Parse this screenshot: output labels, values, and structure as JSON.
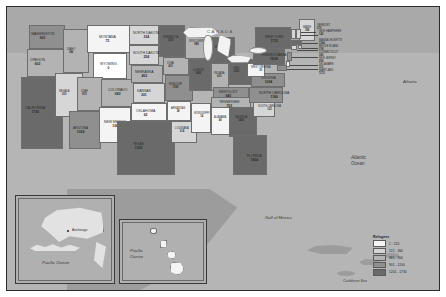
{
  "map": {
    "title": "United States refugee arrivals choropleth map",
    "background_color": "#b5b5b5",
    "border_color": "#2b2b2b"
  },
  "region_labels": {
    "canada": "CANADA",
    "atlantic_top": "Atlantic",
    "atlantic_ocean": "Atlantic\nOcean",
    "atlantic_ocean_line1": "Atlantic",
    "atlantic_ocean_line2": "Ocean",
    "gulf_of_mexico": "Gulf of Mexico",
    "caribbean_sea": "Caribbean Sea",
    "pacific_ocean_alaska": "Pacific Ocean",
    "pacific_ocean_hawaii_line1": "Pacific",
    "pacific_ocean_hawaii_line2": "Ocean",
    "anchorage": "Anchorage"
  },
  "legend": {
    "title": "Refugees",
    "classes": [
      {
        "label": "1 - 120",
        "color": "#f4f4f4"
      },
      {
        "label": "121 - 360",
        "color": "#d6d6d6"
      },
      {
        "label": "361 - 900",
        "color": "#b3b3b3"
      },
      {
        "label": "901 - 1200",
        "color": "#8f8f8f"
      },
      {
        "label": "1201 - 1730",
        "color": "#6a6a6a"
      }
    ]
  },
  "states": [
    {
      "code": "WA",
      "name": "WASHINGTON",
      "value": "901",
      "class": 3,
      "color": "#8f8f8f",
      "x": 22,
      "y": 18,
      "w": 36,
      "h": 24,
      "lx": 24,
      "ly": 26
    },
    {
      "code": "OR",
      "name": "OREGON",
      "value": "602",
      "class": 2,
      "color": "#b3b3b3",
      "x": 20,
      "y": 42,
      "w": 37,
      "h": 28,
      "lx": 23,
      "ly": 52
    },
    {
      "code": "CA",
      "name": "CALIFORNIA",
      "value": "1730",
      "class": 4,
      "color": "#6a6a6a",
      "x": 14,
      "y": 70,
      "w": 42,
      "h": 72,
      "lx": 18,
      "ly": 100
    },
    {
      "code": "NV",
      "name": "NEVADA",
      "value": "203",
      "class": 1,
      "color": "#d6d6d6",
      "x": 48,
      "y": 66,
      "w": 28,
      "h": 44,
      "lx": 52,
      "ly": 84
    },
    {
      "code": "ID",
      "name": "IDAHO",
      "value": "386",
      "class": 2,
      "color": "#b3b3b3",
      "x": 56,
      "y": 22,
      "w": 26,
      "h": 44,
      "lx": 60,
      "ly": 42
    },
    {
      "code": "MT",
      "name": "MONTANA",
      "value": "72",
      "class": 0,
      "color": "#f4f4f4",
      "x": 80,
      "y": 18,
      "w": 44,
      "h": 28,
      "lx": 92,
      "ly": 29
    },
    {
      "code": "WY",
      "name": "WYOMING",
      "value": "0",
      "class": 0,
      "color": "#ffffff",
      "x": 86,
      "y": 46,
      "w": 34,
      "h": 26,
      "lx": 93,
      "ly": 56
    },
    {
      "code": "UT",
      "name": "UTAH",
      "value": "872",
      "class": 2,
      "color": "#b3b3b3",
      "x": 70,
      "y": 70,
      "w": 26,
      "h": 34,
      "lx": 74,
      "ly": 84
    },
    {
      "code": "AZ",
      "name": "ARIZONA",
      "value": "1024",
      "class": 3,
      "color": "#8f8f8f",
      "x": 62,
      "y": 104,
      "w": 32,
      "h": 38,
      "lx": 66,
      "ly": 120
    },
    {
      "code": "CO",
      "name": "COLORADO",
      "value": "682",
      "class": 2,
      "color": "#b3b3b3",
      "x": 94,
      "y": 72,
      "w": 34,
      "h": 28,
      "lx": 101,
      "ly": 82
    },
    {
      "code": "NM",
      "name": "NEW MEXICO",
      "value": "106",
      "class": 0,
      "color": "#f4f4f4",
      "x": 92,
      "y": 100,
      "w": 32,
      "h": 36,
      "lx": 97,
      "ly": 114
    },
    {
      "code": "ND",
      "name": "NORTH DAKOTA",
      "value": "334",
      "class": 1,
      "color": "#d6d6d6",
      "x": 122,
      "y": 18,
      "w": 30,
      "h": 20,
      "lx": 126,
      "ly": 25
    },
    {
      "code": "SD",
      "name": "SOUTH DAKOTA",
      "value": "254",
      "class": 1,
      "color": "#d6d6d6",
      "x": 122,
      "y": 38,
      "w": 30,
      "h": 20,
      "lx": 126,
      "ly": 45
    },
    {
      "code": "NE",
      "name": "NEBRASKA",
      "value": "452",
      "class": 2,
      "color": "#b3b3b3",
      "x": 124,
      "y": 58,
      "w": 32,
      "h": 18,
      "lx": 128,
      "ly": 64
    },
    {
      "code": "KS",
      "name": "KANSAS",
      "value": "301",
      "class": 1,
      "color": "#d6d6d6",
      "x": 126,
      "y": 76,
      "w": 32,
      "h": 20,
      "lx": 130,
      "ly": 83
    },
    {
      "code": "OK",
      "name": "OKLAHOMA",
      "value": "62",
      "class": 0,
      "color": "#f4f4f4",
      "x": 124,
      "y": 96,
      "w": 36,
      "h": 18,
      "lx": 129,
      "ly": 103
    },
    {
      "code": "TX",
      "name": "TEXAS",
      "value": "1536",
      "class": 4,
      "color": "#6a6a6a",
      "x": 110,
      "y": 114,
      "w": 58,
      "h": 54,
      "lx": 126,
      "ly": 136
    },
    {
      "code": "MN",
      "name": "MINNESOTA",
      "value": "1210",
      "class": 4,
      "color": "#6a6a6a",
      "x": 152,
      "y": 18,
      "w": 26,
      "h": 32,
      "lx": 156,
      "ly": 30
    },
    {
      "code": "IA",
      "name": "IOWA",
      "value": "410",
      "class": 2,
      "color": "#b3b3b3",
      "x": 156,
      "y": 50,
      "w": 26,
      "h": 18,
      "lx": 160,
      "ly": 56
    },
    {
      "code": "MO",
      "name": "MISSOURI",
      "value": "1108",
      "class": 3,
      "color": "#8f8f8f",
      "x": 158,
      "y": 68,
      "w": 28,
      "h": 26,
      "lx": 162,
      "ly": 77
    },
    {
      "code": "AR",
      "name": "ARKANSAS",
      "value": "38",
      "class": 0,
      "color": "#f4f4f4",
      "x": 160,
      "y": 94,
      "w": 24,
      "h": 20,
      "lx": 164,
      "ly": 101
    },
    {
      "code": "LA",
      "name": "LOUISIANA",
      "value": "214",
      "class": 1,
      "color": "#d6d6d6",
      "x": 164,
      "y": 114,
      "w": 26,
      "h": 22,
      "lx": 168,
      "ly": 121
    },
    {
      "code": "WI",
      "name": "WISCONSIN",
      "value": "688",
      "class": 2,
      "color": "#b3b3b3",
      "x": 178,
      "y": 24,
      "w": 24,
      "h": 28,
      "lx": 182,
      "ly": 34
    },
    {
      "code": "IL",
      "name": "ILLINOIS",
      "value": "1402",
      "class": 4,
      "color": "#6a6a6a",
      "x": 182,
      "y": 52,
      "w": 22,
      "h": 32,
      "lx": 186,
      "ly": 63
    },
    {
      "code": "MS",
      "name": "MISSISSIPPI",
      "value": "14",
      "class": 0,
      "color": "#f4f4f4",
      "x": 184,
      "y": 96,
      "w": 20,
      "h": 30,
      "lx": 187,
      "ly": 106
    },
    {
      "code": "MI",
      "name": "MICHIGAN",
      "value": "1688",
      "class": 4,
      "color": "#6a6a6a",
      "x": 202,
      "y": 30,
      "w": 26,
      "h": 28,
      "lx": 208,
      "ly": 40
    },
    {
      "code": "IN",
      "name": "INDIANA",
      "value": "620",
      "class": 2,
      "color": "#b3b3b3",
      "x": 204,
      "y": 56,
      "w": 18,
      "h": 28,
      "lx": 207,
      "ly": 66
    },
    {
      "code": "OH",
      "name": "OHIO",
      "value": "1320",
      "class": 4,
      "color": "#6a6a6a",
      "x": 222,
      "y": 52,
      "w": 24,
      "h": 26,
      "lx": 226,
      "ly": 61
    },
    {
      "code": "KY",
      "name": "KENTUCKY",
      "value": "940",
      "class": 3,
      "color": "#8f8f8f",
      "x": 206,
      "y": 80,
      "w": 36,
      "h": 14,
      "lx": 212,
      "ly": 84
    },
    {
      "code": "TN",
      "name": "TENNESSEE",
      "value": "702",
      "class": 2,
      "color": "#b3b3b3",
      "x": 204,
      "y": 90,
      "w": 40,
      "h": 14,
      "lx": 212,
      "ly": 94
    },
    {
      "code": "AL",
      "name": "ALABAMA",
      "value": "46",
      "class": 0,
      "color": "#f4f4f4",
      "x": 204,
      "y": 100,
      "w": 20,
      "h": 28,
      "lx": 207,
      "ly": 110
    },
    {
      "code": "GA",
      "name": "GEORGIA",
      "value": "1426",
      "class": 4,
      "color": "#6a6a6a",
      "x": 222,
      "y": 100,
      "w": 28,
      "h": 30,
      "lx": 228,
      "ly": 110
    },
    {
      "code": "FL",
      "name": "FLORIDA",
      "value": "1604",
      "class": 4,
      "color": "#6a6a6a",
      "x": 226,
      "y": 128,
      "w": 34,
      "h": 40,
      "lx": 240,
      "ly": 148
    },
    {
      "code": "SC",
      "name": "SOUTH CAROLINA",
      "value": "122",
      "class": 1,
      "color": "#d6d6d6",
      "x": 246,
      "y": 94,
      "w": 22,
      "h": 16,
      "lx": 251,
      "ly": 99
    },
    {
      "code": "NC",
      "name": "NORTH CAROLINA",
      "value": "1186",
      "class": 3,
      "color": "#8f8f8f",
      "x": 242,
      "y": 80,
      "w": 34,
      "h": 16,
      "lx": 252,
      "ly": 85
    },
    {
      "code": "VA",
      "name": "VIRGINIA",
      "value": "1094",
      "class": 3,
      "color": "#8f8f8f",
      "x": 244,
      "y": 66,
      "w": 34,
      "h": 14,
      "lx": 254,
      "ly": 70
    },
    {
      "code": "WV",
      "name": "WEST VIRGINIA",
      "value": "30",
      "class": 0,
      "color": "#f4f4f4",
      "x": 240,
      "y": 56,
      "w": 18,
      "h": 14,
      "lx": 244,
      "ly": 60
    },
    {
      "code": "PA",
      "name": "PENNSYLVANIA",
      "value": "1508",
      "class": 4,
      "color": "#6a6a6a",
      "x": 246,
      "y": 40,
      "w": 32,
      "h": 18,
      "lx": 254,
      "ly": 47
    },
    {
      "code": "NY",
      "name": "NEW YORK",
      "value": "1712",
      "class": 4,
      "color": "#6a6a6a",
      "x": 248,
      "y": 20,
      "w": 36,
      "h": 22,
      "lx": 258,
      "ly": 29
    },
    {
      "code": "ME",
      "name": "MAINE",
      "value": "358",
      "class": 1,
      "color": "#d6d6d6",
      "x": 292,
      "y": 12,
      "w": 16,
      "h": 22,
      "lx": 296,
      "ly": 20
    }
  ],
  "small_states": [
    {
      "code": "VT",
      "name": "VERMONT",
      "value": "270",
      "class": 1,
      "color": "#d6d6d6",
      "x": 284,
      "y": 22,
      "w": 5,
      "h": 10,
      "tx": 310,
      "ty": 18,
      "lnx": 289,
      "lny": 25,
      "lnw": 20
    },
    {
      "code": "NH",
      "name": "NEW HAMPSHIRE",
      "value": "142",
      "class": 1,
      "color": "#d6d6d6",
      "x": 289,
      "y": 22,
      "w": 5,
      "h": 10,
      "tx": 312,
      "ty": 24,
      "lnx": 294,
      "lny": 28,
      "lnw": 17
    },
    {
      "code": "MA",
      "name": "MASSACHUSETTS",
      "value": "1264",
      "class": 4,
      "color": "#6a6a6a",
      "x": 284,
      "y": 33,
      "w": 11,
      "h": 5,
      "tx": 312,
      "ty": 33,
      "lnx": 295,
      "lny": 36,
      "lnw": 16
    },
    {
      "code": "RI",
      "name": "RHODE ISLAND",
      "value": "218",
      "class": 1,
      "color": "#d6d6d6",
      "x": 291,
      "y": 38,
      "w": 4,
      "h": 4,
      "tx": 312,
      "ty": 39,
      "lnx": 295,
      "lny": 41,
      "lnw": 16
    },
    {
      "code": "CT",
      "name": "CONNECTICUT",
      "value": "340",
      "class": 1,
      "color": "#d6d6d6",
      "x": 284,
      "y": 38,
      "w": 6,
      "h": 5,
      "tx": 312,
      "ty": 45,
      "lnx": 290,
      "lny": 43,
      "lnw": 21
    },
    {
      "code": "NJ",
      "name": "NEW JERSEY",
      "value": "906",
      "class": 3,
      "color": "#8f8f8f",
      "x": 280,
      "y": 45,
      "w": 5,
      "h": 9,
      "tx": 312,
      "ty": 51,
      "lnx": 285,
      "lny": 50,
      "lnw": 26
    },
    {
      "code": "DE",
      "name": "DELAWARE",
      "value": "110",
      "class": 0,
      "color": "#f4f4f4",
      "x": 279,
      "y": 54,
      "w": 4,
      "h": 6,
      "tx": 312,
      "ty": 57,
      "lnx": 283,
      "lny": 58,
      "lnw": 28
    },
    {
      "code": "MD",
      "name": "MARYLAND",
      "value": "1172",
      "class": 3,
      "color": "#8f8f8f",
      "x": 270,
      "y": 58,
      "w": 10,
      "h": 6,
      "tx": 312,
      "ty": 63,
      "lnx": 280,
      "lny": 62,
      "lnw": 31
    }
  ],
  "insets": {
    "alaska": {
      "name": "Alaska",
      "value": "580",
      "color": "#d6d6d6"
    },
    "hawaii": {
      "name": "Hawaii",
      "value": "96",
      "color": "#f4f4f4"
    }
  }
}
